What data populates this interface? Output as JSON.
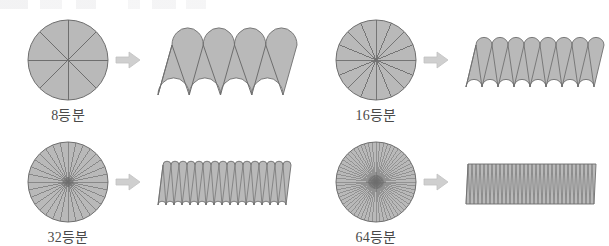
{
  "figure": {
    "background_color": "#ffffff",
    "shape_fill": "#b9b9b9",
    "shape_stroke": "#6e6e6e",
    "arrow_color": "#cfcfcf",
    "caption_color": "#4a4a4a",
    "arrow_icon": "right-arrow-icon"
  },
  "panels": [
    {
      "id": "panel-8",
      "divisions": 8,
      "caption": "8등분",
      "circle": {
        "cx": 58,
        "cy": 52,
        "rx": 40,
        "ry": 40
      },
      "result": {
        "x": 148,
        "y": 28,
        "width": 125,
        "height": 50,
        "shape": "wavy-parallelogram",
        "amplitude": 9,
        "skew": 14
      },
      "arrow": {
        "x": 105,
        "y": 52
      },
      "caption_pos": {
        "x": -17,
        "y": 96
      }
    },
    {
      "id": "panel-16",
      "divisions": 16,
      "caption": "16등분",
      "circle": {
        "cx": 58,
        "cy": 52,
        "rx": 40,
        "ry": 40
      },
      "result": {
        "x": 148,
        "y": 33,
        "width": 128,
        "height": 42,
        "shape": "wavy-parallelogram",
        "amplitude": 4,
        "skew": 10
      },
      "arrow": {
        "x": 105,
        "y": 52
      },
      "caption_pos": {
        "x": -17,
        "y": 96
      }
    },
    {
      "id": "panel-32",
      "divisions": 32,
      "caption": "32등분",
      "circle": {
        "cx": 58,
        "cy": 52,
        "rx": 40,
        "ry": 40
      },
      "result": {
        "x": 148,
        "y": 33,
        "width": 128,
        "height": 40,
        "shape": "near-rectangle",
        "amplitude": 2,
        "skew": 5
      },
      "arrow": {
        "x": 105,
        "y": 52
      },
      "caption_pos": {
        "x": -17,
        "y": 96
      }
    },
    {
      "id": "panel-64",
      "divisions": 64,
      "caption": "64등분",
      "circle": {
        "cx": 58,
        "cy": 52,
        "rx": 40,
        "ry": 40
      },
      "result": {
        "x": 148,
        "y": 33,
        "width": 128,
        "height": 40,
        "shape": "rectangle",
        "amplitude": 1,
        "skew": 2
      },
      "arrow": {
        "x": 105,
        "y": 52
      },
      "caption_pos": {
        "x": -17,
        "y": 96
      }
    }
  ],
  "layout": {
    "panel_origins": [
      {
        "id": "panel-8",
        "left": 10,
        "top": 8
      },
      {
        "id": "panel-16",
        "left": 318,
        "top": 8
      },
      {
        "id": "panel-32",
        "left": 10,
        "top": 130
      },
      {
        "id": "panel-64",
        "left": 318,
        "top": 130
      }
    ]
  }
}
